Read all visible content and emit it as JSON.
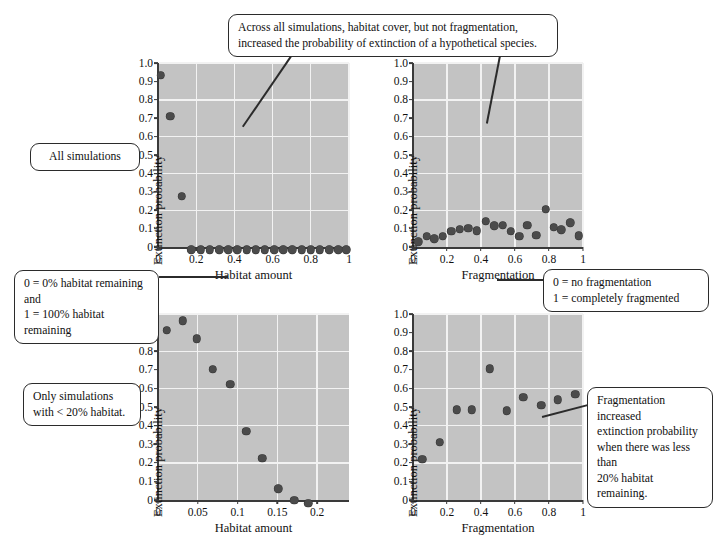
{
  "figure": {
    "background": "#ffffff",
    "plot_bg": "#c3c3c3",
    "grid_color": "#f2f2f2",
    "dot_color": "#4b4b4b"
  },
  "callouts": {
    "top": {
      "id": "callout-top-summary",
      "text": "Across all simulations, habitat cover, but not fragmentation,\nincreased the probability of extinction of a hypothetical species."
    },
    "all_simulations": {
      "id": "callout-all-simulations",
      "text": "All simulations"
    },
    "habitat_scale": {
      "id": "callout-habitat-scale",
      "text": "0 = 0% habitat remaining and\n1 = 100% habitat remaining"
    },
    "fragmentation_scale": {
      "id": "callout-fragmentation-scale",
      "text": "0 = no fragmentation\n1 = completely fragmented"
    },
    "only_simulations": {
      "id": "callout-only-simulations",
      "text": "Only simulations\nwith < 20% habitat."
    },
    "fragmentation_effect": {
      "id": "callout-fragmentation-effect",
      "text": "Fragmentation increased\nextinction probability\nwhen there was less than\n20% habitat remaining."
    }
  },
  "chart_data": [
    {
      "id": "panel-top-left",
      "type": "scatter",
      "title": "",
      "xlabel": "Habitat amount",
      "ylabel": "Extinction probability",
      "xlim": [
        0,
        1
      ],
      "ylim": [
        0,
        1
      ],
      "xticks": [
        0,
        0.2,
        0.4,
        0.6,
        0.8,
        1
      ],
      "xtick_labels": [
        "0",
        "0.2",
        "0.4",
        "0.6",
        "0.8",
        "1"
      ],
      "yticks": [
        0,
        0.1,
        0.2,
        0.3,
        0.4,
        0.5,
        0.6,
        0.7,
        0.8,
        0.9,
        1.0
      ],
      "ytick_labels": [
        "0",
        "0.1",
        "0.2",
        "0.3",
        "0.4",
        "0.5",
        "0.6",
        "0.7",
        "0.8",
        "0.9",
        "1.0"
      ],
      "grid": true,
      "legend": "none",
      "points": [
        {
          "x": 0.015,
          "y": 0.955
        },
        {
          "x": 0.065,
          "y": 0.73
        },
        {
          "x": 0.125,
          "y": 0.295
        },
        {
          "x": 0.175,
          "y": 0.005
        },
        {
          "x": 0.225,
          "y": 0.005
        },
        {
          "x": 0.272,
          "y": 0.005
        },
        {
          "x": 0.32,
          "y": 0.005
        },
        {
          "x": 0.368,
          "y": 0.005
        },
        {
          "x": 0.416,
          "y": 0.005
        },
        {
          "x": 0.464,
          "y": 0.005
        },
        {
          "x": 0.512,
          "y": 0.005
        },
        {
          "x": 0.56,
          "y": 0.005
        },
        {
          "x": 0.608,
          "y": 0.005
        },
        {
          "x": 0.656,
          "y": 0.005
        },
        {
          "x": 0.704,
          "y": 0.005
        },
        {
          "x": 0.752,
          "y": 0.005
        },
        {
          "x": 0.8,
          "y": 0.005
        },
        {
          "x": 0.848,
          "y": 0.005
        },
        {
          "x": 0.896,
          "y": 0.005
        },
        {
          "x": 0.944,
          "y": 0.005
        },
        {
          "x": 0.985,
          "y": 0.005
        }
      ]
    },
    {
      "id": "panel-top-right",
      "type": "scatter",
      "title": "",
      "xlabel": "Fragmentation",
      "ylabel": "Extinction probability",
      "xlim": [
        0,
        1
      ],
      "ylim": [
        0,
        1
      ],
      "xticks": [
        0,
        0.2,
        0.4,
        0.6,
        0.8,
        1
      ],
      "xtick_labels": [
        "0",
        "0.2",
        "0.4",
        "0.6",
        "0.8",
        "1"
      ],
      "yticks": [
        0,
        0.1,
        0.2,
        0.3,
        0.4,
        0.5,
        0.6,
        0.7,
        0.8,
        0.9,
        1.0
      ],
      "ytick_labels": [
        "0",
        "0.1",
        "0.2",
        "0.3",
        "0.4",
        "0.5",
        "0.6",
        "0.7",
        "0.8",
        "0.9",
        "1.0"
      ],
      "grid": true,
      "legend": "none",
      "points": [
        {
          "x": 0.03,
          "y": 0.05
        },
        {
          "x": 0.08,
          "y": 0.08
        },
        {
          "x": 0.125,
          "y": 0.065
        },
        {
          "x": 0.175,
          "y": 0.08
        },
        {
          "x": 0.225,
          "y": 0.105
        },
        {
          "x": 0.275,
          "y": 0.118
        },
        {
          "x": 0.325,
          "y": 0.122
        },
        {
          "x": 0.375,
          "y": 0.11
        },
        {
          "x": 0.428,
          "y": 0.16
        },
        {
          "x": 0.478,
          "y": 0.135
        },
        {
          "x": 0.528,
          "y": 0.138
        },
        {
          "x": 0.575,
          "y": 0.105
        },
        {
          "x": 0.625,
          "y": 0.08
        },
        {
          "x": 0.672,
          "y": 0.14
        },
        {
          "x": 0.725,
          "y": 0.085
        },
        {
          "x": 0.78,
          "y": 0.225
        },
        {
          "x": 0.828,
          "y": 0.128
        },
        {
          "x": 0.872,
          "y": 0.115
        },
        {
          "x": 0.925,
          "y": 0.152
        },
        {
          "x": 0.975,
          "y": 0.082
        }
      ]
    },
    {
      "id": "panel-bottom-left",
      "type": "scatter",
      "title": "",
      "xlabel": "Habitat amount",
      "ylabel": "Extinction probability",
      "xlim": [
        0,
        0.24
      ],
      "ylim": [
        0,
        1
      ],
      "xticks": [
        0,
        0.05,
        0.1,
        0.15,
        0.2
      ],
      "xtick_labels": [
        "0",
        "0.05",
        "0.1",
        "0.15",
        "0.2"
      ],
      "yticks": [
        0,
        0.1,
        0.2,
        0.3,
        0.4,
        0.5,
        0.6,
        0.7,
        0.8,
        0.9,
        1.0
      ],
      "ytick_labels": [
        "0",
        "0.1",
        "0.2",
        "0.3",
        "0.4",
        "0.5",
        "0.6",
        "0.7",
        "0.8",
        "0.9",
        "1.0"
      ],
      "grid": true,
      "legend": "none",
      "points": [
        {
          "x": 0.011,
          "y": 0.932
        },
        {
          "x": 0.031,
          "y": 0.985
        },
        {
          "x": 0.049,
          "y": 0.888
        },
        {
          "x": 0.069,
          "y": 0.722
        },
        {
          "x": 0.091,
          "y": 0.643
        },
        {
          "x": 0.111,
          "y": 0.39
        },
        {
          "x": 0.131,
          "y": 0.246
        },
        {
          "x": 0.151,
          "y": 0.082
        },
        {
          "x": 0.171,
          "y": 0.02
        },
        {
          "x": 0.189,
          "y": 0.003
        }
      ]
    },
    {
      "id": "panel-bottom-right",
      "type": "scatter",
      "title": "",
      "xlabel": "Fragmentation",
      "ylabel": "Extinction probability",
      "xlim": [
        0,
        1
      ],
      "ylim": [
        0,
        1
      ],
      "xticks": [
        0,
        0.2,
        0.4,
        0.6,
        0.8,
        1
      ],
      "xtick_labels": [
        "0",
        "0.2",
        "0.4",
        "0.6",
        "0.8",
        "1"
      ],
      "yticks": [
        0,
        0.1,
        0.2,
        0.3,
        0.4,
        0.5,
        0.6,
        0.7,
        0.8,
        0.9,
        1.0
      ],
      "ytick_labels": [
        "0",
        "0.1",
        "0.2",
        "0.3",
        "0.4",
        "0.5",
        "0.6",
        "0.7",
        "0.8",
        "0.9",
        "1.0"
      ],
      "grid": true,
      "legend": "none",
      "points": [
        {
          "x": 0.055,
          "y": 0.238
        },
        {
          "x": 0.158,
          "y": 0.33
        },
        {
          "x": 0.258,
          "y": 0.505
        },
        {
          "x": 0.345,
          "y": 0.505
        },
        {
          "x": 0.452,
          "y": 0.725
        },
        {
          "x": 0.552,
          "y": 0.5
        },
        {
          "x": 0.648,
          "y": 0.572
        },
        {
          "x": 0.755,
          "y": 0.53
        },
        {
          "x": 0.85,
          "y": 0.558
        },
        {
          "x": 0.955,
          "y": 0.59
        }
      ]
    }
  ]
}
